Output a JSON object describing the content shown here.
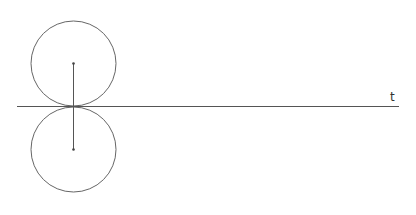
{
  "diagram": {
    "axis": {
      "label": "t",
      "x1": 17,
      "x2": 399,
      "y": 106.5,
      "color": "#555555"
    },
    "circles": [
      {
        "name": "upper-circle",
        "cx": 73.5,
        "cy": 63.5,
        "r": 42.5,
        "color": "#666666"
      },
      {
        "name": "lower-circle",
        "cx": 73.5,
        "cy": 149.5,
        "r": 42.5,
        "color": "#666666"
      }
    ],
    "segment": {
      "x": 73.5,
      "y1": 63.5,
      "y2": 149.5,
      "color": "#555555"
    },
    "points": [
      {
        "name": "upper-center",
        "x": 73.5,
        "y": 63.5
      },
      {
        "name": "lower-center",
        "x": 73.5,
        "y": 149.5
      }
    ]
  }
}
